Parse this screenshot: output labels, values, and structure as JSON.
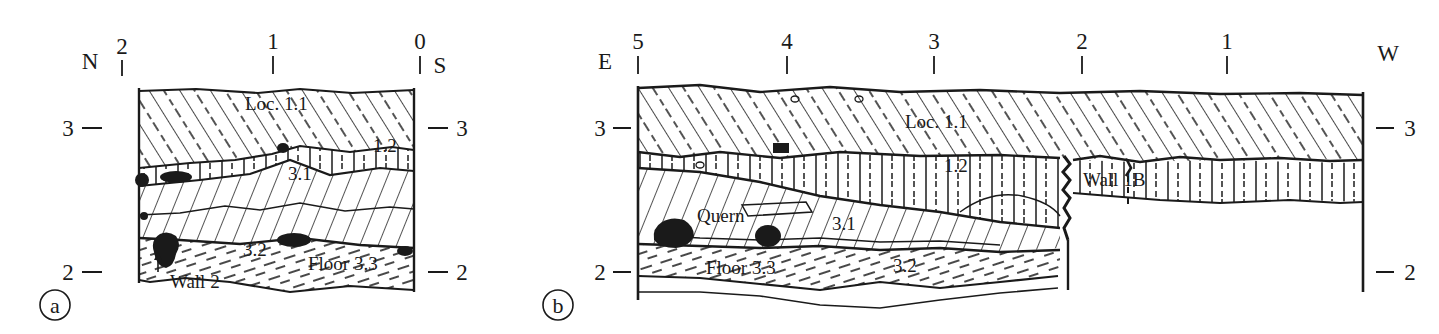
{
  "figure": {
    "background_color": "#ffffff",
    "ink_color": "#1a1a1a"
  },
  "panels": [
    {
      "id": "a",
      "letter": "a",
      "name": "north-south-section",
      "left_compass": "N",
      "right_compass": "S",
      "top_ticks": [
        {
          "label": "2",
          "x": 122
        },
        {
          "label": "1",
          "x": 273
        },
        {
          "label": "0",
          "x": 420
        }
      ],
      "left_elevations": [
        {
          "label": "3",
          "y": 128
        },
        {
          "label": "2",
          "y": 272
        }
      ],
      "right_elevations": [
        {
          "label": "3",
          "y": 128
        },
        {
          "label": "2",
          "y": 272
        }
      ],
      "layer_labels": [
        {
          "text": "Loc. 1.1",
          "x": 245,
          "y": 110,
          "name": "label-loc-1-1"
        },
        {
          "text": "1.2",
          "x": 373,
          "y": 152,
          "name": "label-1-2"
        },
        {
          "text": "3.1",
          "x": 288,
          "y": 180,
          "name": "label-3-1"
        },
        {
          "text": "3.2",
          "x": 243,
          "y": 256,
          "name": "label-3-2"
        },
        {
          "text": "Floor 3.3",
          "x": 308,
          "y": 270,
          "name": "label-floor-3-3"
        },
        {
          "text": "Wall 2",
          "x": 170,
          "y": 288,
          "name": "label-wall-2"
        }
      ]
    },
    {
      "id": "b",
      "letter": "b",
      "name": "east-west-section",
      "left_compass": "E",
      "right_compass": "W",
      "top_ticks": [
        {
          "label": "5",
          "x": 638
        },
        {
          "label": "4",
          "x": 787
        },
        {
          "label": "3",
          "x": 934
        },
        {
          "label": "2",
          "x": 1082
        },
        {
          "label": "1",
          "x": 1227
        }
      ],
      "left_elevations": [
        {
          "label": "3",
          "y": 128
        },
        {
          "label": "2",
          "y": 272
        }
      ],
      "right_elevations": [
        {
          "label": "3",
          "y": 128
        },
        {
          "label": "2",
          "y": 272
        }
      ],
      "layer_labels": [
        {
          "text": "Loc. 1.1",
          "x": 905,
          "y": 128,
          "name": "label-loc-1-1"
        },
        {
          "text": "1.2",
          "x": 944,
          "y": 172,
          "name": "label-1-2"
        },
        {
          "text": "Quern",
          "x": 697,
          "y": 222,
          "name": "label-quern"
        },
        {
          "text": "3.1",
          "x": 832,
          "y": 230,
          "name": "label-3-1"
        },
        {
          "text": "Wall 1B",
          "x": 1083,
          "y": 186,
          "name": "label-wall-1b"
        },
        {
          "text": "3.2",
          "x": 893,
          "y": 272,
          "name": "label-3-2"
        },
        {
          "text": "Floor 3.3",
          "x": 706,
          "y": 274,
          "name": "label-floor-3-3"
        }
      ]
    }
  ],
  "legend_semantics": {
    "loc_1_1_fill": "diagonal-hatch-with-dashes",
    "loc_1_2_fill": "vertical-dash-hatch",
    "loc_3_1_fill": "steep-diagonal-hatch",
    "loc_3_2_fill": "dashed-diagonal-hatch",
    "stone_fill": "solid-black"
  }
}
